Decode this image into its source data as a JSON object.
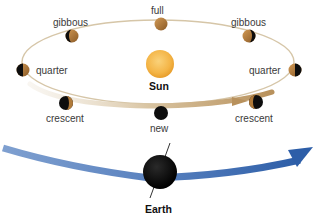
{
  "diagram": {
    "sun": {
      "label": "Sun",
      "color": "#f4b547"
    },
    "earth": {
      "label": "Earth",
      "color": "#0a0a0a"
    },
    "moon_phases": [
      {
        "id": "full",
        "label": "full"
      },
      {
        "id": "gibbous-left",
        "label": "gibbous"
      },
      {
        "id": "gibbous-right",
        "label": "gibbous"
      },
      {
        "id": "quarter-left",
        "label": "quarter"
      },
      {
        "id": "quarter-right",
        "label": "quarter"
      },
      {
        "id": "crescent-left",
        "label": "crescent"
      },
      {
        "id": "crescent-right",
        "label": "crescent"
      },
      {
        "id": "new",
        "label": "new"
      }
    ],
    "colors": {
      "orbit_line": "#c9b48f",
      "orbit_band": "#c9a97a",
      "earth_path": "#3b6cb3",
      "moon_lit": "#b07a3a",
      "moon_dark": "#0d0d0d"
    }
  }
}
